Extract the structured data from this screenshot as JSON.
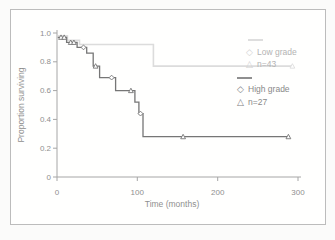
{
  "figure": {
    "kind": "scanned survival chart figure",
    "border_color": "#bcbcbc",
    "background": "#fffffe"
  },
  "legend": {
    "diamond_glyph": "◇",
    "triangle_glyph": "△",
    "low": {
      "label": "Low grade",
      "n": "n=43",
      "color": "#b3b3b3",
      "line_color": "#dedede"
    },
    "high": {
      "label": "High grade",
      "n": "n=27",
      "color": "#898989",
      "line_color": "#8f8f8f"
    }
  },
  "chart_data": {
    "type": "line",
    "subtype": "kaplan-meier-step",
    "title": "",
    "xlabel": "Time (months)",
    "ylabel": "Proportion surviving",
    "xlim": [
      0,
      300
    ],
    "ylim": [
      0,
      1.0
    ],
    "x_ticks": [
      0,
      100,
      200,
      300
    ],
    "y_ticks": [
      1.0,
      0.8,
      0.6,
      0.4,
      0.2,
      0
    ],
    "y_tick_labels": [
      "1.0",
      "0.8",
      "0.6",
      "0.4",
      "0.2",
      "0"
    ],
    "grid": false,
    "legend_position": "inside-right",
    "axis_color": "#a6a6a6",
    "text_color": "#8f8f8f",
    "series": [
      {
        "name": "Low grade",
        "n_label": "n=43",
        "color": "#dcdcdc",
        "width": 1.6,
        "steps": [
          [
            1,
            0.98
          ],
          [
            13,
            0.95
          ],
          [
            28,
            0.92
          ],
          [
            120,
            0.77
          ]
        ],
        "end_t": 293,
        "censor_marks": [
          {
            "t": 293,
            "v": 0.77,
            "shape": "triangle"
          }
        ]
      },
      {
        "name": "High grade",
        "n_label": "n=27",
        "color": "#767676",
        "width": 1.3,
        "steps": [
          [
            1,
            0.97
          ],
          [
            12,
            0.935
          ],
          [
            25,
            0.9
          ],
          [
            37,
            0.86
          ],
          [
            45,
            0.77
          ],
          [
            53,
            0.69
          ],
          [
            73,
            0.6
          ],
          [
            97,
            0.52
          ],
          [
            102,
            0.44
          ],
          [
            107,
            0.28
          ]
        ],
        "end_t": 290,
        "censor_marks": [
          {
            "t": 5,
            "v": 0.97,
            "shape": "triangle"
          },
          {
            "t": 9,
            "v": 0.97,
            "shape": "triangle"
          },
          {
            "t": 17,
            "v": 0.935,
            "shape": "triangle"
          },
          {
            "t": 21,
            "v": 0.935,
            "shape": "triangle"
          },
          {
            "t": 33,
            "v": 0.9,
            "shape": "diamond"
          },
          {
            "t": 48,
            "v": 0.77,
            "shape": "triangle"
          },
          {
            "t": 68,
            "v": 0.69,
            "shape": "diamond"
          },
          {
            "t": 92,
            "v": 0.6,
            "shape": "triangle"
          },
          {
            "t": 104,
            "v": 0.44,
            "shape": "diamond"
          },
          {
            "t": 157,
            "v": 0.28,
            "shape": "triangle"
          },
          {
            "t": 288,
            "v": 0.28,
            "shape": "triangle"
          }
        ]
      }
    ]
  }
}
